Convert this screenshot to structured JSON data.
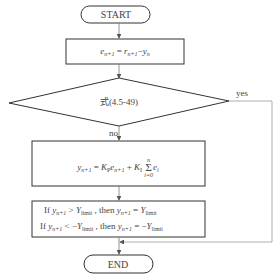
{
  "diagram": {
    "start": "START",
    "end": "END",
    "step1": {
      "lhs": "e",
      "lhs_sub": "n+1",
      "eq": " = ",
      "r": "r",
      "r_sub": "n+1",
      "minus": "−",
      "y": "y",
      "y_sub": "n"
    },
    "decision": "式(4.5-49)",
    "yes_label": "yes",
    "no_label": "no",
    "formula": {
      "y": "y",
      "y_sub": "n+1",
      "eq": " = ",
      "kp": "K",
      "kp_sub": "P",
      "e": "e",
      "e_sub": "n+1",
      "plus": " + ",
      "ki": "K",
      "ki_sub": "I",
      "sum": "Σ",
      "sum_top": "n",
      "sum_bottom": "i=0",
      "ei": "e",
      "ei_sub": "i"
    },
    "limit": {
      "line1": {
        "if": "If ",
        "y": "y",
        "y_sub": "n+1",
        "op": " > ",
        "Y": "Y",
        "Y_sub": "limit",
        "then": " ,  then ",
        "y2": "y",
        "y2_sub": "n+1",
        "eq": " = ",
        "Y2": "Y",
        "Y2_sub": "limit"
      },
      "line2": {
        "if": "If ",
        "y": "y",
        "y_sub": "n+1",
        "op": " < −",
        "Y": "Y",
        "Y_sub": "limit",
        "then": " ,  then ",
        "y2": "y",
        "y2_sub": "n+1",
        "eq": " = −",
        "Y2": "Y",
        "Y2_sub": "limit"
      }
    },
    "colors": {
      "stroke": "#333333",
      "thin": "#888888"
    }
  }
}
